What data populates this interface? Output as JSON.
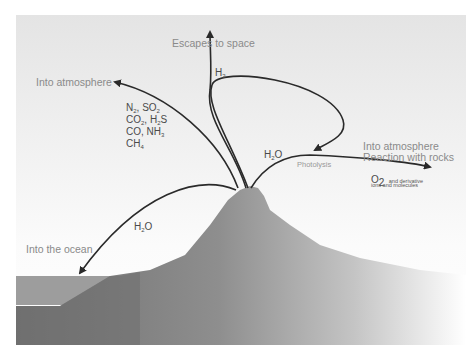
{
  "diagram": {
    "labels": {
      "escapes_to_space": "Escapes to space",
      "into_atmosphere_left": "Into atmosphere",
      "into_atmosphere_right": "Into atmosphere",
      "reaction_with_rocks": "Reaction with rocks",
      "into_the_ocean": "Into the ocean",
      "photolysis": "Photolysis"
    },
    "species": {
      "h2": {
        "base": "H",
        "sub": "2"
      },
      "h2o_right": {
        "pre": "H",
        "sub": "2",
        "post": "O"
      },
      "h2o_left": {
        "pre": "H",
        "sub": "2",
        "post": "O"
      },
      "o2": {
        "base": "O",
        "sub": "2",
        "note": "and derivative",
        "note2": "ions and molecules"
      },
      "gases": [
        {
          "a": "N",
          "as": "2",
          "sep": ", ",
          "b": "SO",
          "bs": "2"
        },
        {
          "a": "CO",
          "as": "2",
          "sep": ", ",
          "b": "H",
          "bs": "2",
          "b2": "S"
        },
        {
          "a": "CO",
          "as": "",
          "sep": ", ",
          "b": "NH",
          "bs": "3"
        },
        {
          "a": "CH",
          "as": "4",
          "sep": "",
          "b": "",
          "bs": ""
        }
      ]
    },
    "colors": {
      "sky_top": "#e6e6e6",
      "sky_bottom": "#ffffff",
      "volcano": "#8f8f8f",
      "volcano_fade": "#f4f4f4",
      "ocean": "#9a9a9a",
      "seafloor": "#6e6e6e",
      "arrow": "#2a2a2a",
      "label_gray": "#8a8a8a"
    }
  }
}
